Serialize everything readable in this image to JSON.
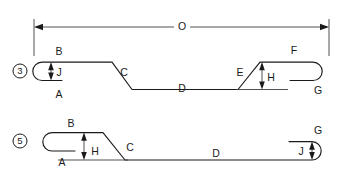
{
  "drawing": {
    "title": "Bar Bend Shape Schedule",
    "background_color": "#ffffff",
    "line_color": "#1a1a1a",
    "dimension_color": "#333333",
    "canvas": {
      "width": 344,
      "height": 182
    }
  },
  "overall_dimension": {
    "label": "O",
    "name": "overall-length",
    "x_start": 34,
    "x_end": 329,
    "y": 27
  },
  "shapes": [
    {
      "id": "shape-3",
      "marker": "3",
      "marker_cx": 20,
      "marker_cy": 71,
      "marker_r": 7,
      "description": "Hook at left, sloped offset down, sloped offset up, hook at right",
      "dimension_labels": [
        {
          "label": "B",
          "name": "dim-b",
          "x": 59,
          "y": 52
        },
        {
          "label": "J",
          "name": "dim-j",
          "x": 59,
          "y": 73
        },
        {
          "label": "A",
          "name": "dim-a",
          "x": 59,
          "y": 95
        },
        {
          "label": "C",
          "name": "dim-c",
          "x": 124,
          "y": 73
        },
        {
          "label": "D",
          "name": "dim-d",
          "x": 182,
          "y": 89
        },
        {
          "label": "E",
          "name": "dim-e",
          "x": 240,
          "y": 73
        },
        {
          "label": "F",
          "name": "dim-f",
          "x": 294,
          "y": 51
        },
        {
          "label": "H",
          "name": "dim-h",
          "x": 271,
          "y": 78
        },
        {
          "label": "G",
          "name": "dim-g",
          "x": 318,
          "y": 91
        }
      ]
    },
    {
      "id": "shape-5",
      "marker": "5",
      "marker_cx": 20,
      "marker_cy": 141,
      "marker_r": 7,
      "description": "Hook at left raised, sloped offset down to long leg, hook at right",
      "dimension_labels": [
        {
          "label": "B",
          "name": "dim-b",
          "x": 71,
          "y": 124
        },
        {
          "label": "A",
          "name": "dim-a",
          "x": 62,
          "y": 163
        },
        {
          "label": "H",
          "name": "dim-h",
          "x": 90,
          "y": 152
        },
        {
          "label": "C",
          "name": "dim-c",
          "x": 130,
          "y": 148
        },
        {
          "label": "D",
          "name": "dim-d",
          "x": 216,
          "y": 161
        },
        {
          "label": "G",
          "name": "dim-g",
          "x": 318,
          "y": 131
        },
        {
          "label": "J",
          "name": "dim-j",
          "x": 303,
          "y": 152
        }
      ]
    }
  ]
}
